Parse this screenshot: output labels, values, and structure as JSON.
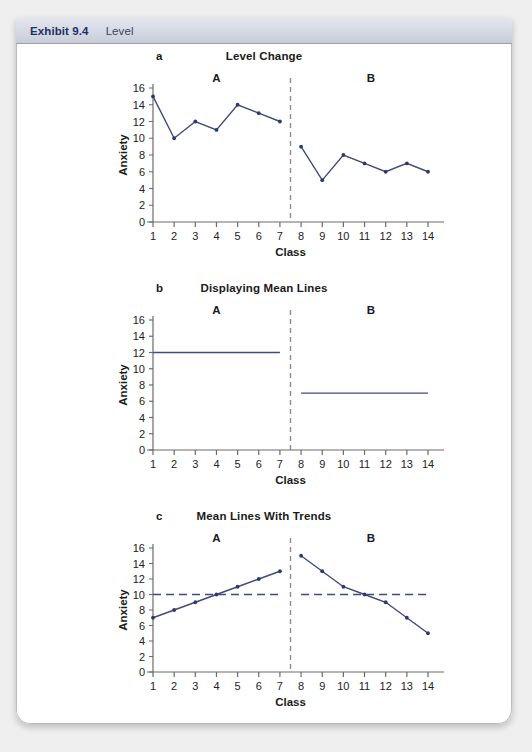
{
  "header": {
    "exhibit_label": "Exhibit 9.4",
    "exhibit_title": "Level"
  },
  "colors": {
    "series_line": "#3f4a7e",
    "marker": "#2f3a6b",
    "phase_divider": "#8c8c8c",
    "mean_dash": "#3f4a7e",
    "axis": "#6b6b6b",
    "header_text": "#1f2f63",
    "card_background": "#ffffff",
    "page_background": "#efeff0"
  },
  "panels": [
    {
      "letter": "a",
      "title": "Level Change",
      "phase_a_label": "A",
      "phase_b_label": "B"
    },
    {
      "letter": "b",
      "title": "Displaying Mean Lines",
      "phase_a_label": "A",
      "phase_b_label": "B"
    },
    {
      "letter": "c",
      "title": "Mean Lines With Trends",
      "phase_a_label": "A",
      "phase_b_label": "B"
    }
  ],
  "axes": {
    "xlabel": "Class",
    "ylabel": "Anxiety",
    "xticks": [
      "1",
      "2",
      "3",
      "4",
      "5",
      "6",
      "7",
      "8",
      "9",
      "10",
      "11",
      "12",
      "13",
      "14"
    ],
    "yticks": [
      "0",
      "2",
      "4",
      "6",
      "8",
      "10",
      "12",
      "14",
      "16"
    ],
    "xlim": [
      1,
      14
    ],
    "ylim": [
      0,
      16
    ],
    "phase_break_x": 7.5
  },
  "chart_data": [
    {
      "type": "line",
      "title": "Level Change",
      "panel": "a",
      "xlabel": "Class",
      "ylabel": "Anxiety",
      "xlim": [
        1,
        14
      ],
      "ylim": [
        0,
        16
      ],
      "grid": false,
      "legend": "none",
      "annotations": [
        "A",
        "B"
      ],
      "phase_break_x": 7.5,
      "x": [
        1,
        2,
        3,
        4,
        5,
        6,
        7,
        8,
        9,
        10,
        11,
        12,
        13,
        14
      ],
      "series": [
        {
          "name": "Phase A",
          "x": [
            1,
            2,
            3,
            4,
            5,
            6,
            7
          ],
          "values": [
            15,
            10,
            12,
            11,
            14,
            13,
            12
          ]
        },
        {
          "name": "Phase B",
          "x": [
            8,
            9,
            10,
            11,
            12,
            13,
            14
          ],
          "values": [
            9,
            5,
            8,
            7,
            6,
            7,
            6
          ]
        }
      ]
    },
    {
      "type": "line",
      "title": "Displaying Mean Lines",
      "panel": "b",
      "xlabel": "Class",
      "ylabel": "Anxiety",
      "xlim": [
        1,
        14
      ],
      "ylim": [
        0,
        16
      ],
      "grid": false,
      "legend": "none",
      "annotations": [
        "A",
        "B"
      ],
      "phase_break_x": 7.5,
      "series": [
        {
          "name": "Phase A mean line",
          "x": [
            1,
            7
          ],
          "values": [
            12,
            12
          ]
        },
        {
          "name": "Phase B mean line",
          "x": [
            8,
            14
          ],
          "values": [
            7,
            7
          ]
        }
      ]
    },
    {
      "type": "line",
      "title": "Mean Lines With Trends",
      "panel": "c",
      "xlabel": "Class",
      "ylabel": "Anxiety",
      "xlim": [
        1,
        14
      ],
      "ylim": [
        0,
        16
      ],
      "grid": false,
      "legend": "none",
      "annotations": [
        "A",
        "B"
      ],
      "phase_break_x": 7.5,
      "series": [
        {
          "name": "Phase A trend",
          "x": [
            1,
            2,
            3,
            4,
            5,
            6,
            7
          ],
          "values": [
            7,
            8,
            9,
            10,
            11,
            12,
            13
          ]
        },
        {
          "name": "Phase B trend",
          "x": [
            8,
            9,
            10,
            11,
            12,
            13,
            14
          ],
          "values": [
            15,
            13,
            11,
            10,
            9,
            7,
            5
          ]
        },
        {
          "name": "Phase A mean",
          "style": "dashed",
          "x": [
            1,
            7
          ],
          "values": [
            10,
            10
          ]
        },
        {
          "name": "Phase B mean",
          "style": "dashed",
          "x": [
            8,
            14
          ],
          "values": [
            10,
            10
          ]
        }
      ]
    }
  ]
}
